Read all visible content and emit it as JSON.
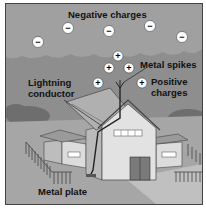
{
  "diagram": {
    "labels": {
      "negative_charges": "Negative charges",
      "metal_spikes": "Metal spikes",
      "positive_charges_line1": "Positive",
      "positive_charges_line2": "charges",
      "lightning_conductor_line1": "Lightning",
      "lightning_conductor_line2": "conductor",
      "metal_plate": "Metal plate"
    },
    "symbols": {
      "negative": "−",
      "positive": "+"
    },
    "negative_charge_count": 5,
    "positive_charge_count": 5,
    "colors": {
      "sky": "#8a8a8a",
      "cloud": "#9c9c9c",
      "ground": "#a8a8a8",
      "house_wall": "#d8d8d8",
      "roof": "#b4b4b4",
      "door": "#7a7a7a",
      "conductor": "#333333"
    }
  }
}
